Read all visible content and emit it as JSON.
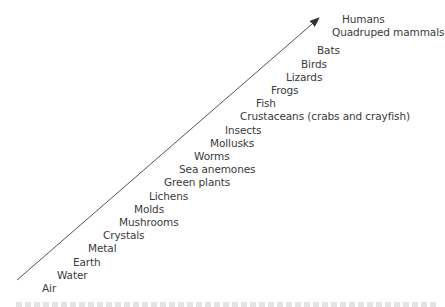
{
  "diagram": {
    "type": "scale-of-nature",
    "arrow": {
      "from": [
        17,
        280
      ],
      "to": [
        319,
        18
      ],
      "color": "#333333"
    },
    "levels": [
      {
        "label": "Air",
        "x": 42,
        "y": 282
      },
      {
        "label": "Water",
        "x": 57,
        "y": 269
      },
      {
        "label": "Earth",
        "x": 73,
        "y": 256
      },
      {
        "label": "Metal",
        "x": 88,
        "y": 242
      },
      {
        "label": "Crystals",
        "x": 103,
        "y": 229
      },
      {
        "label": "Mushrooms",
        "x": 119,
        "y": 216
      },
      {
        "label": "Molds",
        "x": 134,
        "y": 203
      },
      {
        "label": "Lichens",
        "x": 149,
        "y": 190
      },
      {
        "label": "Green plants",
        "x": 164,
        "y": 176
      },
      {
        "label": "Sea anemones",
        "x": 179,
        "y": 163
      },
      {
        "label": "Worms",
        "x": 194,
        "y": 150
      },
      {
        "label": "Mollusks",
        "x": 210,
        "y": 137
      },
      {
        "label": "Insects",
        "x": 225,
        "y": 124
      },
      {
        "label": "Crustaceans (crabs and crayfish)",
        "x": 240,
        "y": 110
      },
      {
        "label": "Fish",
        "x": 256,
        "y": 97
      },
      {
        "label": "Frogs",
        "x": 271,
        "y": 84
      },
      {
        "label": "Lizards",
        "x": 286,
        "y": 71
      },
      {
        "label": "Birds",
        "x": 301,
        "y": 58
      },
      {
        "label": "Bats",
        "x": 317,
        "y": 44
      },
      {
        "label": "Quadruped mammals",
        "x": 332,
        "y": 26
      },
      {
        "label": "Humans",
        "x": 342,
        "y": 13
      }
    ]
  }
}
